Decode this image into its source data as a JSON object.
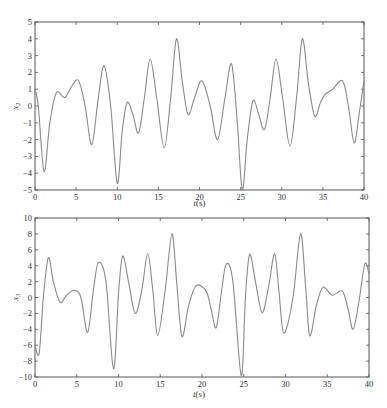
{
  "chart_data": [
    {
      "type": "line",
      "title": "",
      "xlabel": "t(s)",
      "ylabel": "x2",
      "xlim": [
        0,
        40
      ],
      "ylim": [
        -5,
        5
      ],
      "xticks": [
        0,
        5,
        10,
        15,
        20,
        25,
        30,
        35,
        40
      ],
      "yticks": [
        -5,
        -4,
        -3,
        -2,
        -1,
        0,
        1,
        2,
        3,
        4,
        5
      ],
      "grid": false,
      "legend": null,
      "line_color": "#8a8a8a",
      "series": [
        {
          "name": "x2",
          "x": [
            0,
            0.4,
            1.1,
            1.8,
            2.6,
            3.6,
            4.5,
            5.3,
            6.1,
            6.9,
            7.7,
            8.4,
            9.2,
            10.0,
            10.6,
            11.2,
            11.9,
            12.6,
            13.3,
            14.0,
            14.8,
            15.7,
            16.5,
            17.2,
            17.9,
            18.6,
            19.4,
            20.3,
            21.3,
            22.2,
            23.1,
            23.9,
            24.6,
            25.2,
            25.8,
            26.5,
            27.2,
            27.9,
            28.6,
            29.3,
            30.1,
            31.0,
            31.8,
            32.5,
            33.2,
            34.0,
            34.7,
            35.3,
            36.2,
            37.4,
            38.1,
            38.8,
            39.4,
            40.0
          ],
          "y": [
            1.0,
            0.0,
            -3.9,
            -1.0,
            0.8,
            0.5,
            1.2,
            1.5,
            0.0,
            -2.3,
            0.5,
            2.4,
            0.0,
            -4.6,
            -1.5,
            0.2,
            -0.5,
            -1.6,
            0.5,
            2.8,
            0.5,
            -2.5,
            0.5,
            4.0,
            1.5,
            -0.5,
            0.5,
            1.5,
            0.0,
            -2.0,
            0.5,
            2.5,
            -1.0,
            -5.0,
            -2.0,
            0.3,
            -0.5,
            -1.4,
            0.5,
            2.8,
            0.5,
            -2.4,
            0.5,
            4.0,
            1.5,
            -0.6,
            0.2,
            0.7,
            1.0,
            1.5,
            0.0,
            -2.2,
            -0.5,
            1.5
          ]
        }
      ]
    },
    {
      "type": "line",
      "title": "",
      "xlabel": "t(s)",
      "ylabel": "x3",
      "xlim": [
        0,
        40
      ],
      "ylim": [
        -10,
        10
      ],
      "xticks": [
        0,
        5,
        10,
        15,
        20,
        25,
        30,
        35,
        40
      ],
      "yticks": [
        -10,
        -8,
        -6,
        -4,
        -2,
        0,
        2,
        4,
        6,
        8,
        10
      ],
      "grid": false,
      "legend": null,
      "line_color": "#8a8a8a",
      "series": [
        {
          "name": "x3",
          "x": [
            0,
            0.5,
            1.0,
            1.6,
            2.2,
            3.0,
            3.8,
            4.7,
            5.5,
            6.3,
            7.0,
            7.6,
            8.5,
            9.4,
            10.0,
            10.5,
            11.2,
            12.0,
            12.8,
            13.5,
            14.1,
            14.7,
            15.6,
            16.4,
            17.0,
            17.6,
            18.4,
            19.3,
            20.5,
            21.1,
            21.7,
            22.3,
            22.9,
            23.7,
            24.7,
            25.2,
            25.7,
            26.4,
            27.2,
            28.0,
            28.7,
            29.2,
            29.8,
            30.9,
            31.8,
            32.4,
            32.9,
            33.7,
            34.5,
            35.6,
            36.8,
            37.5,
            38.1,
            38.8,
            39.5,
            40.0
          ],
          "y": [
            -6.0,
            -7.0,
            0.0,
            5.0,
            2.0,
            -0.6,
            0.3,
            0.9,
            0.0,
            -4.4,
            1.0,
            4.4,
            2.0,
            -9.0,
            0.5,
            5.2,
            2.0,
            -2.0,
            1.0,
            5.5,
            1.0,
            -4.8,
            1.0,
            8.0,
            1.5,
            -4.9,
            -1.0,
            1.5,
            0.8,
            -1.5,
            -3.8,
            0.5,
            4.2,
            2.0,
            -9.8,
            0.0,
            5.4,
            2.0,
            -1.9,
            1.5,
            5.5,
            1.0,
            -4.5,
            0.0,
            8.0,
            1.5,
            -4.8,
            -1.0,
            1.3,
            0.3,
            0.8,
            -1.5,
            -4.0,
            -0.5,
            4.2,
            3.0
          ]
        }
      ]
    }
  ]
}
